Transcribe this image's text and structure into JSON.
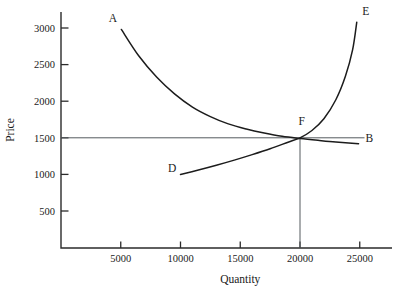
{
  "chart_data": {
    "type": "line",
    "title": "",
    "xlabel": "Quantity",
    "ylabel": "Price",
    "xlim": [
      0,
      26500
    ],
    "ylim": [
      0,
      3300
    ],
    "grid": false,
    "legend": "none",
    "x_ticks": [
      {
        "value": 5000,
        "label": "5000"
      },
      {
        "value": 10000,
        "label": "10000"
      },
      {
        "value": 15000,
        "label": "15000"
      },
      {
        "value": 20000,
        "label": "20000"
      },
      {
        "value": 25000,
        "label": "25000"
      }
    ],
    "y_ticks": [
      {
        "value": 500,
        "label": "500"
      },
      {
        "value": 1000,
        "label": "1000"
      },
      {
        "value": 1500,
        "label": "1500"
      },
      {
        "value": 2000,
        "label": "2000"
      },
      {
        "value": 2500,
        "label": "2500"
      },
      {
        "value": 3000,
        "label": "3000"
      }
    ],
    "series": [
      {
        "name": "demand-curve",
        "start_label": "A",
        "end_label": "B",
        "points": [
          {
            "x": 5050,
            "y": 2980
          },
          {
            "x": 6500,
            "y": 2620
          },
          {
            "x": 8000,
            "y": 2330
          },
          {
            "x": 9500,
            "y": 2100
          },
          {
            "x": 11000,
            "y": 1920
          },
          {
            "x": 12500,
            "y": 1790
          },
          {
            "x": 14000,
            "y": 1690
          },
          {
            "x": 15500,
            "y": 1620
          },
          {
            "x": 17000,
            "y": 1565
          },
          {
            "x": 18500,
            "y": 1520
          },
          {
            "x": 20000,
            "y": 1490
          },
          {
            "x": 21500,
            "y": 1465
          },
          {
            "x": 23000,
            "y": 1442
          },
          {
            "x": 24900,
            "y": 1420
          }
        ]
      },
      {
        "name": "supply-curve",
        "start_label": "D",
        "end_label": "E",
        "points": [
          {
            "x": 10000,
            "y": 1000
          },
          {
            "x": 11500,
            "y": 1060
          },
          {
            "x": 13000,
            "y": 1125
          },
          {
            "x": 14500,
            "y": 1195
          },
          {
            "x": 16000,
            "y": 1270
          },
          {
            "x": 17500,
            "y": 1350
          },
          {
            "x": 19000,
            "y": 1440
          },
          {
            "x": 20000,
            "y": 1500
          },
          {
            "x": 21000,
            "y": 1600
          },
          {
            "x": 22000,
            "y": 1760
          },
          {
            "x": 23000,
            "y": 2020
          },
          {
            "x": 23800,
            "y": 2340
          },
          {
            "x": 24400,
            "y": 2700
          },
          {
            "x": 24750,
            "y": 3080
          }
        ]
      }
    ],
    "annotations": [
      {
        "name": "label-A",
        "text": "A",
        "x": 4350,
        "y": 3080
      },
      {
        "name": "label-B",
        "text": "B",
        "x": 25800,
        "y": 1440
      },
      {
        "name": "label-D",
        "text": "D",
        "x": 9300,
        "y": 1030
      },
      {
        "name": "label-E",
        "text": "E",
        "x": 25500,
        "y": 3180
      },
      {
        "name": "label-F",
        "text": "F",
        "x": 20150,
        "y": 1680
      }
    ],
    "equilibrium": {
      "name": "equilibrium-point-F",
      "label": "F",
      "x": 20000,
      "y": 1500,
      "price_guide_from_y_axis": true,
      "quantity_guide_to_x_axis": true
    },
    "colors": {
      "curve": "#1c1c1c",
      "axis": "#2b2b2b",
      "guide": "#555a5e",
      "background": "#ffffff"
    }
  }
}
